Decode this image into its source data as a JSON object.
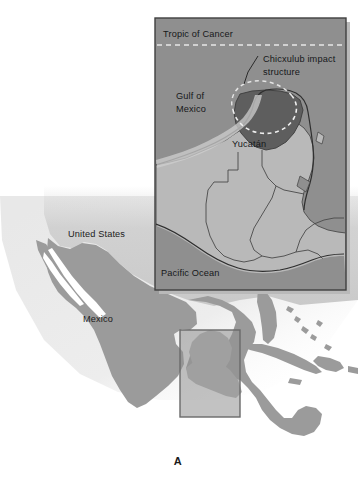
{
  "figure": {
    "panel_letter": "A",
    "width": 358,
    "height": 494
  },
  "palette": {
    "page_background": "#ffffff",
    "ocean_main": "#ffffff",
    "ocean_haze": "#ebebeb",
    "land_light": "#c9c9c9",
    "land_mid": "#9b9b9b",
    "land_dark": "#808080",
    "inset_ocean": "#8f8f8f",
    "inset_land": "#b9b9b9",
    "impact_fill": "#5e5e5e",
    "border_line": "#3a3a3a",
    "frame_line": "#3f3f3f",
    "dashed_white": "#f2f2f2",
    "text_color": "#1b1b1b"
  },
  "main_map": {
    "name": "regional-map-mexico-central-america",
    "labels": [
      {
        "id": "united-states",
        "text": "United States",
        "x": 68,
        "y": 237
      },
      {
        "id": "mexico",
        "text": "Mexico",
        "x": 83,
        "y": 322
      }
    ],
    "locator_box": {
      "label": "inset-locator-box",
      "x": 180,
      "y": 330,
      "width": 60,
      "height": 87
    }
  },
  "inset_map": {
    "name": "inset-map-yucatan-chicxulub",
    "frame": {
      "x": 155,
      "y": 18,
      "width": 191,
      "height": 272
    },
    "labels": [
      {
        "id": "tropic-of-cancer",
        "text": "Tropic of Cancer",
        "x": 163,
        "y": 37
      },
      {
        "id": "gulf-of-mexico-line1",
        "text": "Gulf of",
        "x": 176,
        "y": 99
      },
      {
        "id": "gulf-of-mexico-line2",
        "text": "Mexico",
        "x": 176,
        "y": 112
      },
      {
        "id": "chicxulub-line1",
        "text": "Chicxulub impact",
        "x": 263,
        "y": 62
      },
      {
        "id": "chicxulub-line2",
        "text": "structure",
        "x": 263,
        "y": 75
      },
      {
        "id": "yucatan",
        "text": "Yucatán",
        "x": 232,
        "y": 147
      },
      {
        "id": "pacific-ocean",
        "text": "Pacific Ocean",
        "x": 161,
        "y": 276
      }
    ],
    "tropic_line": {
      "y": 45,
      "style": "dashed",
      "x_start": 157,
      "x_end": 344
    }
  }
}
